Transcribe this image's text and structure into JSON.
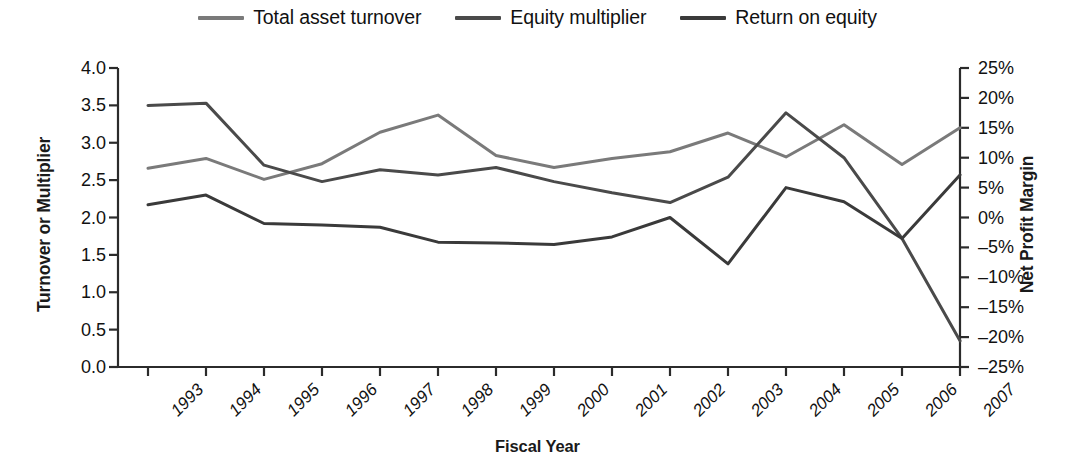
{
  "chart_data": {
    "type": "line",
    "title": "",
    "xlabel": "Fiscal Year",
    "ylabel": "Turnover or Multiplier",
    "ylabel_secondary": "Net Profit Margin",
    "categories": [
      "1993",
      "1994",
      "1995",
      "1996",
      "1997",
      "1998",
      "1999",
      "2000",
      "2001",
      "2002",
      "2003",
      "2004",
      "2005",
      "2006",
      "2007"
    ],
    "ylim": [
      0.0,
      4.0
    ],
    "yticks": [
      "0.0",
      "0.5",
      "1.0",
      "1.5",
      "2.0",
      "2.5",
      "3.0",
      "3.5",
      "4.0"
    ],
    "ytick_values": [
      0.0,
      0.5,
      1.0,
      1.5,
      2.0,
      2.5,
      3.0,
      3.5,
      4.0
    ],
    "ylim_secondary": [
      -25,
      25
    ],
    "yticks_secondary": [
      "-25%",
      "-20%",
      "-15%",
      "-10%",
      "-5%",
      "0%",
      "5%",
      "10%",
      "15%",
      "20%",
      "25%"
    ],
    "ytick_values_secondary": [
      -25,
      -20,
      -15,
      -10,
      -5,
      0,
      5,
      10,
      15,
      20,
      25
    ],
    "grid": false,
    "legend_position": "top-center",
    "series": [
      {
        "name": "Total asset turnover",
        "axis": "left",
        "color": "#7a7a7a",
        "values": [
          2.66,
          2.79,
          2.51,
          2.72,
          3.14,
          3.37,
          2.83,
          2.67,
          2.79,
          2.88,
          3.13,
          2.81,
          3.24,
          2.71,
          3.2
        ]
      },
      {
        "name": "Equity multiplier",
        "axis": "left",
        "color": "#4a4a4a",
        "values": [
          3.5,
          3.53,
          2.7,
          2.48,
          2.64,
          2.57,
          2.67,
          2.48,
          2.33,
          2.2,
          2.54,
          3.4,
          2.8,
          1.72,
          0.35
        ]
      },
      {
        "name": "Return on equity",
        "axis": "right",
        "color": "#3a3a3a",
        "values": [
          1.7,
          3.0,
          -0.8,
          -1.2,
          -1.3,
          -3.3,
          -3.4,
          -3.6,
          -2.6,
          0.0,
          -6.2,
          4.0,
          2.1,
          -2.8,
          5.7
        ],
        "values_left_scale": [
          2.17,
          2.3,
          1.92,
          1.9,
          1.87,
          1.67,
          1.66,
          1.64,
          1.74,
          2.0,
          1.38,
          2.4,
          2.21,
          1.72,
          2.57
        ]
      }
    ]
  },
  "legend": {
    "items": [
      {
        "label": "Total asset turnover",
        "color": "#7a7a7a"
      },
      {
        "label": "Equity multiplier",
        "color": "#4a4a4a"
      },
      {
        "label": "Return on equity",
        "color": "#3a3a3a"
      }
    ]
  },
  "axes": {
    "x_title": "Fiscal Year",
    "y_title_left": "Turnover or Multiplier",
    "y_title_right": "Net Profit Margin"
  },
  "colors": {
    "axis": "#2b2b2b",
    "text": "#111111",
    "background": "#ffffff"
  }
}
